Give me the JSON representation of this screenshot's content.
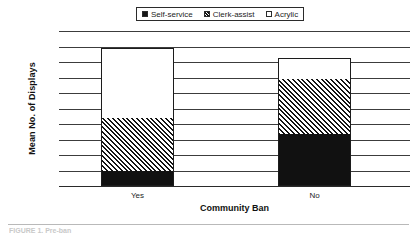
{
  "chart_data": {
    "type": "bar",
    "subtype": "stacked-bar",
    "title": "",
    "xlabel": "Community Ban",
    "ylabel": "Mean No. of Displays",
    "categories": [
      "Yes",
      "No"
    ],
    "series": [
      {
        "name": "Self-service",
        "values": [
          0.48,
          1.68
        ],
        "fill": "solid-black",
        "color": "#111111"
      },
      {
        "name": "Clerk-assist",
        "values": [
          1.72,
          1.77
        ],
        "fill": "diagonal-hatch",
        "color": "#141414"
      },
      {
        "name": "Acrylic",
        "values": [
          2.25,
          0.67
        ],
        "fill": "white-open",
        "color": "#ffffff"
      }
    ],
    "totals": [
      4.45,
      4.12
    ],
    "ylim": [
      0,
      5
    ],
    "ytick_step": 0.5,
    "yticks": [
      "5",
      "4.5",
      "4",
      "3.5",
      "3",
      "2.5",
      "2",
      "1.5",
      "1",
      "0.5",
      "0"
    ],
    "ytick_values": [
      5,
      4.5,
      4,
      3.5,
      3,
      2.5,
      2,
      1.5,
      1,
      0.5,
      0
    ],
    "grid": true,
    "grid_color": "#3c3c3c",
    "legend_position": "top-center",
    "legend_boxed": true,
    "background": "#ffffff"
  },
  "legend": {
    "items": [
      {
        "label": "Self-service",
        "swatch": "solid-black-swatch"
      },
      {
        "label": "Clerk-assist",
        "swatch": "hatched-swatch"
      },
      {
        "label": "Acrylic",
        "swatch": "open-white-swatch"
      }
    ]
  },
  "footer": {
    "caption": "FIGURE 1. Pre-ban"
  }
}
